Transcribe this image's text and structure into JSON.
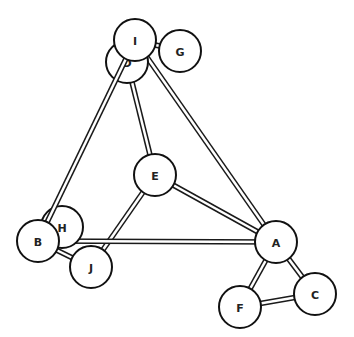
{
  "diagram": {
    "type": "ball-and-stick graph",
    "node_radius": 21,
    "colors": {
      "stroke": "#111111",
      "fill": "#ffffff",
      "background": "#ffffff"
    },
    "nodes": [
      {
        "id": "D",
        "label": "D",
        "x": 127,
        "y": 62
      },
      {
        "id": "I",
        "label": "I",
        "x": 135,
        "y": 40
      },
      {
        "id": "G",
        "label": "G",
        "x": 180,
        "y": 51
      },
      {
        "id": "E",
        "label": "E",
        "x": 155,
        "y": 175
      },
      {
        "id": "H",
        "label": "H",
        "x": 62,
        "y": 227
      },
      {
        "id": "J",
        "label": "J",
        "x": 91,
        "y": 267
      },
      {
        "id": "B",
        "label": "B",
        "x": 38,
        "y": 241
      },
      {
        "id": "A",
        "label": "A",
        "x": 276,
        "y": 242
      },
      {
        "id": "C",
        "label": "C",
        "x": 315,
        "y": 294
      },
      {
        "id": "F",
        "label": "F",
        "x": 240,
        "y": 307
      }
    ],
    "edges": [
      {
        "from": "I",
        "to": "G"
      },
      {
        "from": "D",
        "to": "E"
      },
      {
        "from": "I",
        "to": "A"
      },
      {
        "from": "E",
        "to": "A"
      },
      {
        "from": "E",
        "to": "J"
      },
      {
        "from": "B",
        "to": "A"
      },
      {
        "from": "B",
        "to": "J"
      },
      {
        "from": "A",
        "to": "F"
      },
      {
        "from": "A",
        "to": "C"
      },
      {
        "from": "F",
        "to": "C"
      },
      {
        "from": "I",
        "to": "B"
      }
    ]
  }
}
